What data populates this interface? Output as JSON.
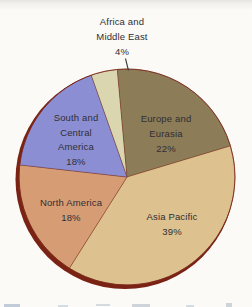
{
  "figure": {
    "background_color": "#fbfaf6",
    "label_color": "#302e35"
  },
  "chart_data": {
    "type": "pie",
    "title": "",
    "unit": "%",
    "direction": "clockwise",
    "start_angle_deg": 340.6,
    "rim_color": "#7a2315",
    "edge_color": "#6e2517",
    "legend": "none",
    "slices": [
      {
        "label": "Africa and Middle East",
        "value": 4,
        "percent_label": "4%",
        "color": "#d9d6b0",
        "label_lines": [
          "Africa and",
          "Middle East",
          "4%"
        ],
        "label_position": "outside-top"
      },
      {
        "label": "Europe and Eurasia",
        "value": 22,
        "percent_label": "22%",
        "color": "#8d7c58",
        "label_lines": [
          "Europe and",
          "Eurasia",
          "22%"
        ],
        "label_position": "inside"
      },
      {
        "label": "Asia Pacific",
        "value": 39,
        "percent_label": "39%",
        "color": "#ddc18f",
        "label_lines": [
          "Asia Pacific",
          "39%"
        ],
        "label_position": "inside"
      },
      {
        "label": "North America",
        "value": 18,
        "percent_label": "18%",
        "color": "#d69c74",
        "label_lines": [
          "North America",
          "18%"
        ],
        "label_position": "inside"
      },
      {
        "label": "South and Central America",
        "value": 18,
        "percent_label": "18%",
        "color": "#8b8ed3",
        "label_lines": [
          "South and",
          "Central",
          "America",
          "18%"
        ],
        "label_position": "inside"
      }
    ]
  }
}
